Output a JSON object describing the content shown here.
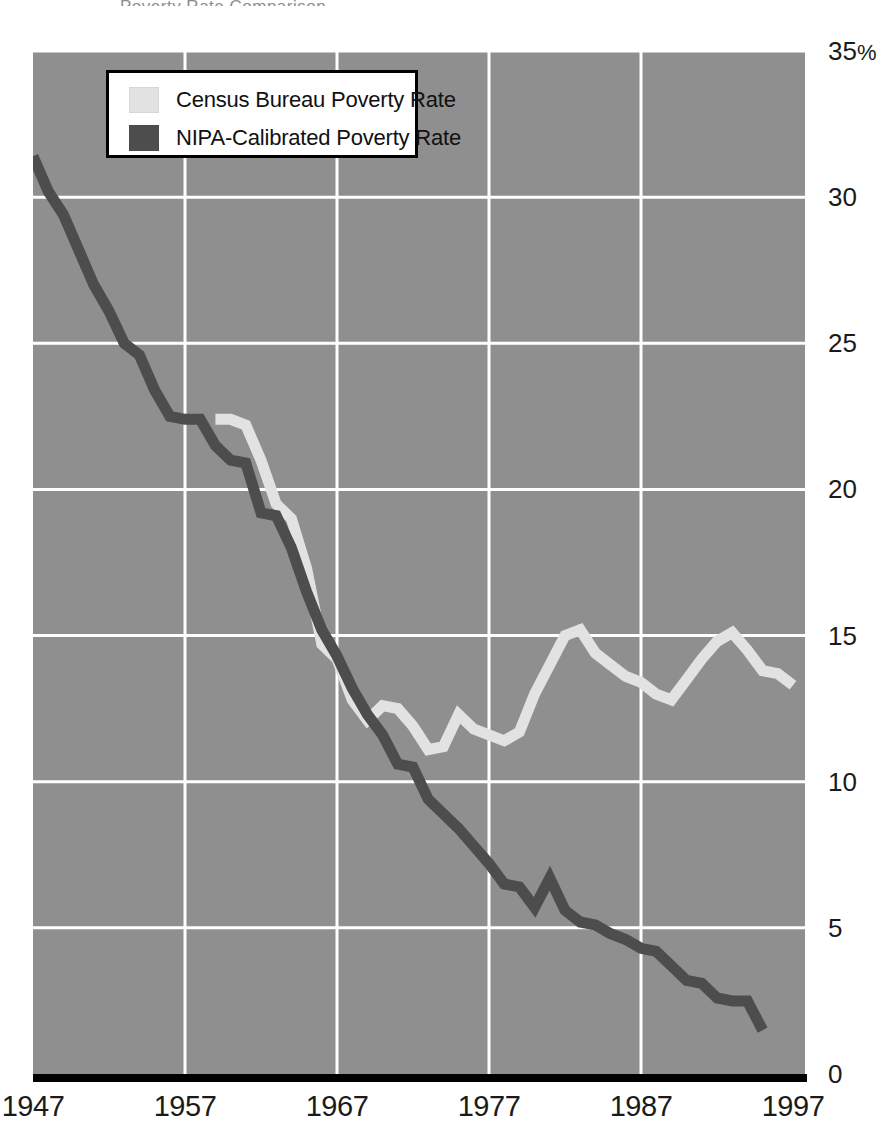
{
  "title_sliver": "Poverty Rate Comparison",
  "colors": {
    "plot_background": "#8f8f8f",
    "gridline": "#ffffff",
    "census_line": "#e2e2e2",
    "nipa_line": "#4d4d4d",
    "axis_baseline": "#000000",
    "legend_background": "#ffffff",
    "legend_border": "#000000",
    "tick_text": "#1a1a1a"
  },
  "legend": {
    "items": [
      {
        "label": "Census Bureau Poverty Rate",
        "color": "#e2e2e2",
        "key": "census"
      },
      {
        "label": "NIPA-Calibrated Poverty Rate",
        "color": "#4d4d4d",
        "key": "nipa"
      }
    ]
  },
  "axes": {
    "y_ticks": [
      {
        "label": "35",
        "suffix": "%",
        "value": 35
      },
      {
        "label": "30",
        "suffix": "",
        "value": 30
      },
      {
        "label": "25",
        "suffix": "",
        "value": 25
      },
      {
        "label": "20",
        "suffix": "",
        "value": 20
      },
      {
        "label": "15",
        "suffix": "",
        "value": 15
      },
      {
        "label": "10",
        "suffix": "",
        "value": 10
      },
      {
        "label": "5",
        "suffix": "",
        "value": 5
      },
      {
        "label": "0",
        "suffix": "",
        "value": 0
      }
    ],
    "x_ticks": [
      {
        "label": "1947",
        "value": 1947
      },
      {
        "label": "1957",
        "value": 1957
      },
      {
        "label": "1967",
        "value": 1967
      },
      {
        "label": "1977",
        "value": 1977
      },
      {
        "label": "1987",
        "value": 1987
      },
      {
        "label": "1997",
        "value": 1997
      }
    ]
  },
  "chart_data": {
    "type": "line",
    "title": "",
    "subtitle": "",
    "xlabel": "",
    "ylabel": "",
    "xlim": [
      1947,
      1997
    ],
    "ylim": [
      0,
      35
    ],
    "y_unit": "%",
    "grid": true,
    "grid_x_values": [
      1957,
      1967,
      1977,
      1987
    ],
    "grid_y_values": [
      5,
      10,
      15,
      20,
      25,
      30,
      35
    ],
    "legend_position": "top-left-inside",
    "series": [
      {
        "name": "Census Bureau Poverty Rate",
        "color": "#e2e2e2",
        "x": [
          1959,
          1960,
          1961,
          1962,
          1963,
          1964,
          1965,
          1966,
          1967,
          1968,
          1969,
          1970,
          1971,
          1972,
          1973,
          1974,
          1975,
          1976,
          1977,
          1978,
          1979,
          1980,
          1981,
          1982,
          1983,
          1984,
          1985,
          1986,
          1987,
          1988,
          1989,
          1990,
          1991,
          1992,
          1993,
          1994,
          1995,
          1996,
          1997
        ],
        "values": [
          22.4,
          22.4,
          22.2,
          21.0,
          19.5,
          19.0,
          17.3,
          14.7,
          14.2,
          12.8,
          12.1,
          12.6,
          12.5,
          11.9,
          11.1,
          11.2,
          12.3,
          11.8,
          11.6,
          11.4,
          11.7,
          13.0,
          14.0,
          15.0,
          15.2,
          14.4,
          14.0,
          13.6,
          13.4,
          13.0,
          12.8,
          13.5,
          14.2,
          14.8,
          15.1,
          14.5,
          13.8,
          13.7,
          13.3
        ]
      },
      {
        "name": "NIPA-Calibrated Poverty Rate",
        "color": "#4d4d4d",
        "x": [
          1947,
          1948,
          1949,
          1950,
          1951,
          1952,
          1953,
          1954,
          1955,
          1956,
          1957,
          1958,
          1959,
          1960,
          1961,
          1962,
          1963,
          1964,
          1965,
          1966,
          1967,
          1968,
          1969,
          1970,
          1971,
          1972,
          1973,
          1974,
          1975,
          1976,
          1977,
          1978,
          1979,
          1980,
          1981,
          1982,
          1983,
          1984,
          1985,
          1986,
          1987,
          1988,
          1989,
          1990,
          1991,
          1992,
          1993,
          1994,
          1995
        ],
        "values": [
          31.4,
          30.2,
          29.4,
          28.2,
          27.0,
          26.1,
          25.0,
          24.6,
          23.4,
          22.5,
          22.4,
          22.4,
          21.5,
          21.0,
          20.9,
          19.2,
          19.1,
          18.0,
          16.5,
          15.2,
          14.3,
          13.2,
          12.3,
          11.6,
          10.6,
          10.5,
          9.4,
          8.9,
          8.4,
          7.8,
          7.2,
          6.5,
          6.4,
          5.7,
          6.7,
          5.6,
          5.2,
          5.1,
          4.8,
          4.6,
          4.3,
          4.2,
          3.7,
          3.2,
          3.1,
          2.6,
          2.5,
          2.5,
          1.5
        ]
      }
    ]
  }
}
